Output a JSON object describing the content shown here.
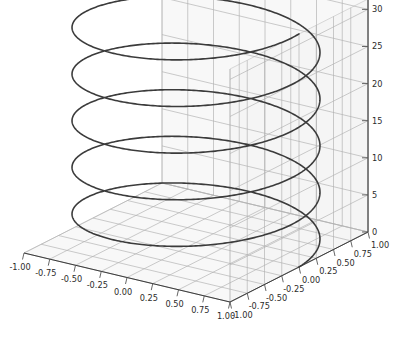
{
  "figure": {
    "title": "",
    "background_color": "#ffffff",
    "width": 398,
    "height": 343,
    "projection": "3d"
  },
  "style": {
    "line_color": "#3b3b3b",
    "grid_color": "#b0b0b0",
    "pane_color": "#f2f2f2",
    "pane_edge_color": "#c8c8c8",
    "axis_line_color": "#3c3c3c",
    "tick_color": "#555555",
    "tick_label_color": "#2b2b2b",
    "line_width": 1.6
  },
  "axes": {
    "x": {
      "label": "",
      "min": -1.0,
      "max": 1.0,
      "tick_values": [
        -1.0,
        -0.75,
        -0.5,
        -0.25,
        0.0,
        0.25,
        0.5,
        0.75,
        1.0
      ],
      "tick_labels": [
        "-1.00",
        "-0.75",
        "-0.50",
        "-0.25",
        "0.00",
        "0.25",
        "0.50",
        "0.75",
        "1.00"
      ]
    },
    "y": {
      "label": "",
      "min": -1.0,
      "max": 1.0,
      "tick_values": [
        1.0,
        0.75,
        0.5,
        0.25,
        0.0,
        -0.25,
        -0.5,
        -0.75,
        -1.0
      ],
      "tick_labels": [
        "1.00",
        "0.75",
        "0.50",
        "0.25",
        "0.00",
        "-0.25",
        "-0.50",
        "-0.75",
        "-1.00"
      ]
    },
    "z": {
      "label": "",
      "min": 0,
      "max": 31.4,
      "tick_values": [
        0,
        5,
        10,
        15,
        20,
        25,
        30
      ],
      "tick_labels": [
        "0",
        "5",
        "10",
        "15",
        "20",
        "25",
        "30"
      ]
    }
  },
  "chart_data": {
    "type": "line",
    "title": "",
    "xlabel": "",
    "ylabel": "",
    "zlabel": "",
    "grid": true,
    "legend": null,
    "xlim": [
      -1.0,
      1.0
    ],
    "ylim": [
      -1.0,
      1.0
    ],
    "zlim": [
      0,
      31.4
    ],
    "view": {
      "elevation": 18,
      "azimuth": -60
    },
    "series": [
      {
        "name": "helix",
        "parametric": true,
        "equation": {
          "x": "cos(t)",
          "y": "sin(t)",
          "z": "t"
        },
        "t_start": 0,
        "t_end": 31.4159,
        "turns": 5,
        "color": "#3b3b3b",
        "linewidth": 1.6,
        "x": [
          1.0,
          0.809,
          0.309,
          -0.309,
          -0.809,
          -1.0,
          -0.809,
          -0.309,
          0.309,
          0.809,
          1.0,
          0.809,
          0.309,
          -0.309,
          -0.809,
          -1.0,
          -0.809,
          -0.309,
          0.309,
          0.809,
          1.0,
          0.809,
          0.309,
          -0.309,
          -0.809,
          -1.0,
          -0.809,
          -0.309,
          0.309,
          0.809,
          1.0,
          0.809,
          0.309,
          -0.309,
          -0.809,
          -1.0,
          -0.809,
          -0.309,
          0.309,
          0.809,
          1.0,
          0.809,
          0.309,
          -0.309,
          -0.809,
          -1.0,
          -0.809,
          -0.309,
          0.309,
          0.809,
          1.0
        ],
        "y": [
          0.0,
          0.588,
          0.951,
          0.951,
          0.588,
          0.0,
          -0.588,
          -0.951,
          -0.951,
          -0.588,
          0.0,
          0.588,
          0.951,
          0.951,
          0.588,
          0.0,
          -0.588,
          -0.951,
          -0.951,
          -0.588,
          0.0,
          0.588,
          0.951,
          0.951,
          0.588,
          0.0,
          -0.588,
          -0.951,
          -0.951,
          -0.588,
          0.0,
          0.588,
          0.951,
          0.951,
          0.588,
          0.0,
          -0.588,
          -0.951,
          -0.951,
          -0.588,
          0.0,
          0.588,
          0.951,
          0.951,
          0.588,
          0.0,
          -0.588,
          -0.951,
          -0.951,
          -0.588,
          0.0
        ],
        "z": [
          0.0,
          0.628,
          1.257,
          1.885,
          2.513,
          3.142,
          3.77,
          4.398,
          5.027,
          5.655,
          6.283,
          6.912,
          7.54,
          8.168,
          8.796,
          9.425,
          10.053,
          10.681,
          11.31,
          11.938,
          12.566,
          13.195,
          13.823,
          14.451,
          15.08,
          15.708,
          16.336,
          16.964,
          17.593,
          18.221,
          18.85,
          19.478,
          20.106,
          20.735,
          21.363,
          21.991,
          22.619,
          23.248,
          23.876,
          24.504,
          25.133,
          25.761,
          26.389,
          27.018,
          27.646,
          28.274,
          28.903,
          29.531,
          30.159,
          30.788,
          31.416
        ]
      }
    ]
  }
}
